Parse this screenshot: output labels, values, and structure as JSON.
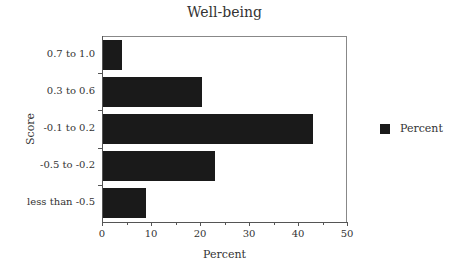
{
  "chart_data": {
    "type": "bar",
    "orientation": "horizontal",
    "title": "Well-being",
    "xlabel": "Percent",
    "ylabel": "Score",
    "xlim": [
      0,
      50
    ],
    "xticks": [
      0,
      10,
      20,
      30,
      40,
      50
    ],
    "categories": [
      "0.7 to 1.0",
      "0.3 to 0.6",
      "-0.1 to 0.2",
      "-0.5 to -0.2",
      "less than -0.5"
    ],
    "series": [
      {
        "name": "Percent",
        "color": "#1a1a1a",
        "values": [
          4,
          20.5,
          43,
          23,
          9
        ]
      }
    ],
    "legend": {
      "position": "right",
      "entries": [
        "Percent"
      ]
    },
    "grid": false
  }
}
